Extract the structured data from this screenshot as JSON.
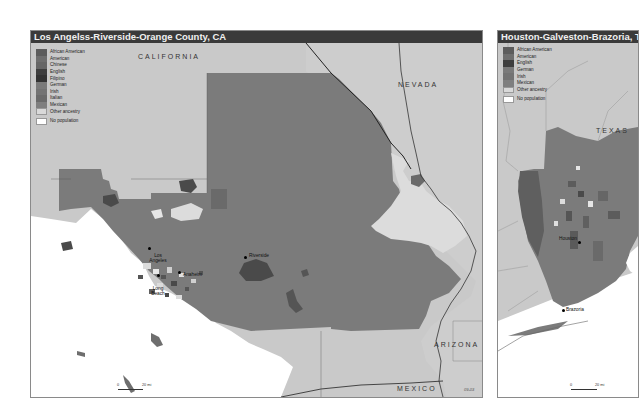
{
  "maps": [
    {
      "title": "Los Angelss-Riverside-Orange County, CA",
      "legend": [
        {
          "label": "African American",
          "color": "#5c5c5c"
        },
        {
          "label": "American",
          "color": "#6e6e6e"
        },
        {
          "label": "Chinese",
          "color": "#666666"
        },
        {
          "label": "English",
          "color": "#3e3e3e"
        },
        {
          "label": "Filipino",
          "color": "#333333"
        },
        {
          "label": "German",
          "color": "#7a7a7a"
        },
        {
          "label": "Irish",
          "color": "#737373"
        },
        {
          "label": "Italian",
          "color": "#6a6a6a"
        },
        {
          "label": "Mexican",
          "color": "#7f7f7f"
        },
        {
          "label": "Other ancestry",
          "color": "#d9d9d9"
        },
        {
          "label": "No population",
          "color": "#ffffff"
        }
      ],
      "state_labels": [
        "CALIFORNIA",
        "NEVADA",
        "ARIZONA",
        "MEXICO"
      ],
      "cities": [
        "Los Angeles",
        "Riverside",
        "Anaheim",
        "Long Beach"
      ],
      "scale": {
        "start": "0",
        "end": "20 mi"
      },
      "code": "09-03"
    },
    {
      "title": "Houston-Galveston-Brazoria, TX",
      "legend": [
        {
          "label": "African American",
          "color": "#5c5c5c"
        },
        {
          "label": "American",
          "color": "#6e6e6e"
        },
        {
          "label": "English",
          "color": "#3e3e3e"
        },
        {
          "label": "German",
          "color": "#7a7a7a"
        },
        {
          "label": "Irish",
          "color": "#737373"
        },
        {
          "label": "Mexican",
          "color": "#7f7f7f"
        },
        {
          "label": "Other ancestry",
          "color": "#d9d9d9"
        },
        {
          "label": "No population",
          "color": "#ffffff"
        }
      ],
      "state_labels": [
        "TEXAS"
      ],
      "cities": [
        "Houston",
        "Brazoria"
      ],
      "scale": {
        "start": "0",
        "end": "20 mi"
      }
    }
  ],
  "colors": {
    "land_outside": "#c9c9c9",
    "metro_fill": "#7b7b7b",
    "water": "#ffffff",
    "other_ancestry": "#dcdcdc",
    "dark_patch": "#4a4a4a",
    "title_bar": "#3a3a3a"
  }
}
